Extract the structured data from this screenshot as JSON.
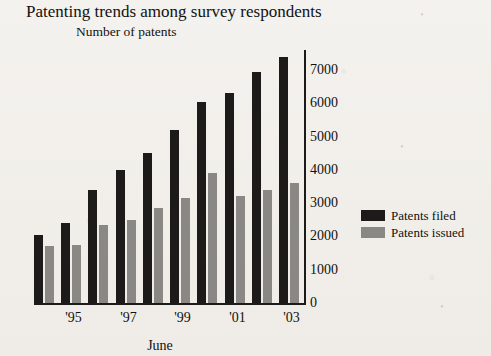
{
  "chart_data": {
    "type": "bar",
    "title": "Patenting trends among survey respondents",
    "subtitle": "Number of patents",
    "xlabel": "June",
    "ylabel": "Number of patents",
    "categories": [
      "'94",
      "'95",
      "'96",
      "'97",
      "'98",
      "'99",
      "'00",
      "'01",
      "'02",
      "'03"
    ],
    "tick_labels": [
      "",
      "'95",
      "",
      "'97",
      "",
      "'99",
      "",
      "'01",
      "",
      "'03"
    ],
    "series": [
      {
        "name": "Patents filed",
        "color": "#1d1b1a",
        "values": [
          2050,
          2400,
          3400,
          4000,
          4500,
          5200,
          6050,
          6300,
          6950,
          7400
        ]
      },
      {
        "name": "Patents issued",
        "color": "#8a8884",
        "values": [
          1700,
          1750,
          2350,
          2500,
          2850,
          3150,
          3900,
          3200,
          3400,
          3600
        ]
      }
    ],
    "ylim": [
      0,
      7600
    ],
    "yticks": [
      0,
      1000,
      2000,
      3000,
      4000,
      5000,
      6000,
      7000
    ],
    "ytick_labels": [
      "0",
      "1000",
      "2000",
      "3000",
      "4000",
      "5000",
      "6000",
      "7000"
    ],
    "grid": false,
    "legend_position": "right",
    "y_axis_side": "right"
  },
  "legend": {
    "items": [
      {
        "label": "Patents filed"
      },
      {
        "label": "Patents issued"
      }
    ]
  },
  "background_marks": {
    "a": "•",
    "b": "•",
    "c": "•"
  }
}
